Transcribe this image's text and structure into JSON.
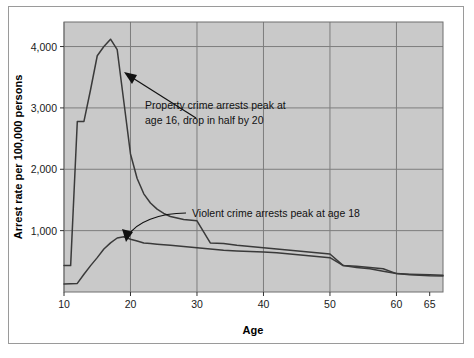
{
  "chart_data": {
    "type": "line",
    "title": "",
    "xlabel": "Age",
    "ylabel": "Arrest rate per 100,000 persons",
    "xlim": [
      10,
      67
    ],
    "ylim": [
      0,
      4400
    ],
    "grid": true,
    "legend_position": "none",
    "x_tick_labels": [
      "10",
      "20",
      "30",
      "40",
      "50",
      "60",
      "65"
    ],
    "x_ticks": [
      10,
      20,
      30,
      40,
      50,
      60,
      65
    ],
    "y_tick_labels": [
      "1,000",
      "2,000",
      "3,000",
      "4,000"
    ],
    "y_ticks": [
      1000,
      2000,
      3000,
      4000
    ],
    "x": [
      10,
      11,
      12,
      13,
      14,
      15,
      16,
      17,
      18,
      19,
      20,
      21,
      22,
      23,
      24,
      25,
      26,
      28,
      30,
      32,
      34,
      36,
      38,
      40,
      42,
      44,
      46,
      48,
      50,
      52,
      54,
      56,
      58,
      60,
      62,
      65,
      67
    ],
    "series": [
      {
        "name": "Property crime arrest rate",
        "values": [
          430,
          430,
          2780,
          2780,
          3300,
          3850,
          4000,
          4120,
          3950,
          3100,
          2250,
          1850,
          1600,
          1450,
          1350,
          1280,
          1230,
          1180,
          1160,
          800,
          790,
          760,
          740,
          720,
          700,
          680,
          660,
          640,
          620,
          430,
          420,
          400,
          380,
          300,
          290,
          280,
          275
        ]
      },
      {
        "name": "Violent crime arrest rate",
        "values": [
          130,
          135,
          140,
          290,
          430,
          560,
          700,
          800,
          880,
          900,
          860,
          830,
          800,
          790,
          780,
          770,
          760,
          740,
          720,
          700,
          680,
          670,
          660,
          650,
          640,
          620,
          600,
          580,
          560,
          430,
          400,
          380,
          340,
          300,
          280,
          265,
          260
        ]
      }
    ],
    "annotations": [
      {
        "id": "property-annotation",
        "line1": "Property crime arrests peak at",
        "line2": "age 16, drop in half by 20",
        "points_to_x": 17.5,
        "points_to_y": 3700
      },
      {
        "id": "violent-annotation",
        "line1": "Violent crime arrests peak at age 18",
        "line2": "",
        "points_to_x": 18.5,
        "points_to_y": 880
      }
    ],
    "colors": {
      "plot_background": "#c9c9c9",
      "grid_line": "#7d7d7d",
      "series_line": "#3a3a3a",
      "frame_border": "#9a9a9a",
      "page_background": "#ffffff",
      "text": "#111111"
    }
  }
}
